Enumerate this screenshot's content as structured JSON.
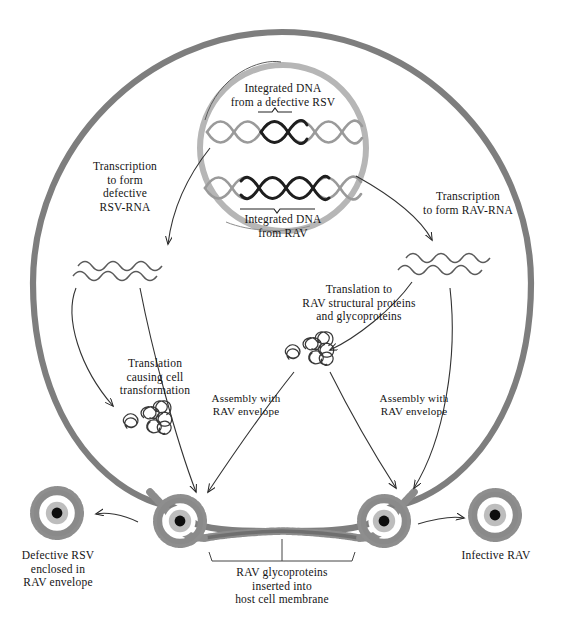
{
  "figure": {
    "nucleus": {
      "dna_top_label": "Integrated DNA\nfrom a defective RSV",
      "dna_bottom_label": "Integrated DNA\nfrom RAV"
    },
    "labels": {
      "transcription_left": "Transcription\nto form\ndefective\nRSV-RNA",
      "transcription_right": "Transcription\nto form RAV-RNA",
      "translation_rav": "Translation to\nRAV structural proteins\nand glycoproteins",
      "translation_transform": "Translation\ncausing cell\ntransformation",
      "assembly_left": "Assembly with\nRAV envelope",
      "assembly_right": "Assembly with\nRAV envelope",
      "product_left": "Defective RSV\nenclosed in\nRAV envelope",
      "product_right": "Infective RAV",
      "membrane_note": "RAV glycoproteins\ninserted into\nhost cell membrane"
    },
    "colors": {
      "cell_membrane": "#7e7e7e",
      "nuclear_envelope": "#b4b4b4",
      "dna_strand_light": "#9a9a9a",
      "dna_strand_dark": "#1e1e1e",
      "virion_spike_ring": "#8c8c8c",
      "virion_envelope": "#9c9c9c",
      "virion_capsid": "#b9b9b9",
      "virion_core": "#0d0d0d",
      "ink": "#141414",
      "background": "#ffffff"
    },
    "elements": {
      "rna_left_name": "defective-rsv-rna",
      "rna_right_name": "rav-rna",
      "protein_left_name": "transforming-protein-aggregate",
      "protein_right_name": "rav-structural-protein-aggregate",
      "virion_free_left_name": "defective-rsv-in-rav-envelope",
      "virion_free_right_name": "infective-rav",
      "virion_budding_left_name": "budding-virion-left",
      "virion_budding_right_name": "budding-virion-right"
    }
  }
}
